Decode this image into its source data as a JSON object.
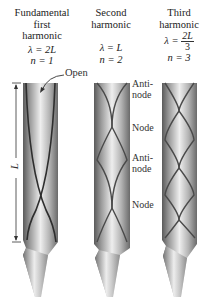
{
  "columns": [
    {
      "title_lines": [
        "Fundamental",
        "first",
        "harmonic"
      ],
      "wavelength": "λ = 2L",
      "wavelength_lhs": "λ =",
      "wavelength_rhs": "2L",
      "mode": "n = 1"
    },
    {
      "title_lines": [
        "Second",
        "harmonic"
      ],
      "wavelength": "λ = L",
      "wavelength_lhs": "λ =",
      "wavelength_rhs": "L",
      "mode": "n = 2"
    },
    {
      "title_lines": [
        "Third",
        "harmonic"
      ],
      "wavelength": "λ = 2L/3",
      "wavelength_lhs": "λ =",
      "wavelength_num": "2L",
      "wavelength_den": "3",
      "mode": "n = 3"
    }
  ],
  "annotations": {
    "open_label": "Open",
    "length_label": "L",
    "side_labels": [
      {
        "line1": "Anti-",
        "line2": "node"
      },
      {
        "line1": "Node"
      },
      {
        "line1": "Anti-",
        "line2": "node"
      },
      {
        "line1": "Node"
      }
    ]
  },
  "colors": {
    "tube_dark": "#5a5a5a",
    "tube_light": "#e6e6e6",
    "wave_line": "#3a3a3a",
    "background": "#ffffff"
  }
}
